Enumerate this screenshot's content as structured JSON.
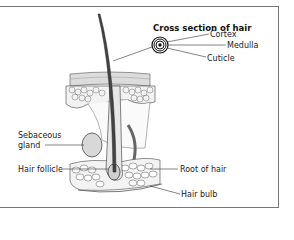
{
  "diagram": {
    "title": "Cross section of hair",
    "cross_section_labels": {
      "cortex": "Cortex",
      "medulla": "Medulla",
      "cuticle": "Cuticle"
    },
    "left_labels": {
      "sebaceous_line1": "Sebaceous",
      "sebaceous_line2": "gland",
      "hair_follicle": "Hair follicle"
    },
    "right_labels": {
      "root_of_hair": "Root of hair",
      "hair_bulb": "Hair bulb"
    },
    "colors": {
      "line": "#333333",
      "skin_fill": "#e6e6e6",
      "cell_fill": "#f4f4f4",
      "frame": "#777777"
    }
  }
}
